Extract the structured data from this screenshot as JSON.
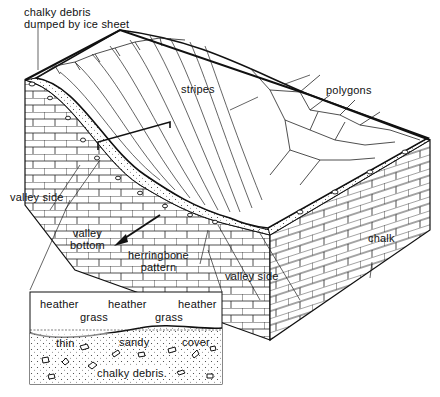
{
  "diagram": {
    "type": "block diagram of a dry chalk valley with periglacial patterned ground",
    "colors": {
      "ink": "#111111",
      "background": "#ffffff"
    },
    "labels": {
      "debris_top_line1": "chalky debris",
      "debris_top_line2": "dumped by ice sheet",
      "stripes": "stripes",
      "polygons": "polygons",
      "valley_side_left": "valley side",
      "valley_bottom_line1": "valley",
      "valley_bottom_line2": "bottom",
      "herringbone_line1": "herringbone",
      "herringbone_line2": "pattern",
      "valley_side_right": "valley side",
      "chalk": "chalk"
    },
    "inset": {
      "vegetation_top": [
        "heather",
        "heather",
        "heather"
      ],
      "vegetation_mid": [
        "grass",
        "grass"
      ],
      "cover": [
        "thin",
        "sandy",
        "cover"
      ],
      "debris": "chalky debris."
    }
  }
}
